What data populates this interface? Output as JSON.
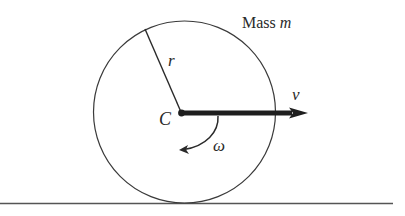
{
  "figure": {
    "labels": {
      "mass_word": "Mass",
      "mass_symbol": "m",
      "radius": "r",
      "center": "C",
      "velocity": "v",
      "angular_velocity": "ω"
    },
    "colors": {
      "stroke": "#3a3a3a",
      "arrow": "#1e1e1e",
      "ground": "#555555",
      "text": "#2a2a2a",
      "background": "#ffffff"
    },
    "geometry": {
      "disk_center": [
        184,
        112
      ],
      "disk_radius": 91,
      "ground_y": 203,
      "velocity_arrow": {
        "from": [
          181,
          113
        ],
        "to": [
          308,
          113
        ]
      },
      "radius_line": {
        "from": [
          145,
          29
        ],
        "to": [
          181,
          112
        ]
      }
    }
  }
}
